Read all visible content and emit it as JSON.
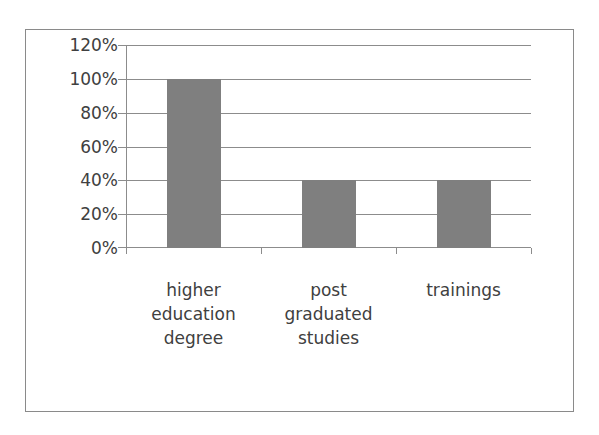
{
  "chart_data": {
    "type": "bar",
    "title": "",
    "xlabel": "",
    "ylabel": "",
    "categories": [
      "higher education degree",
      "post graduated studies",
      "trainings"
    ],
    "category_labels_wrapped": [
      "higher\neducation\ndegree",
      "post\ngraduated\nstudies",
      "trainings"
    ],
    "values": [
      100,
      40,
      40
    ],
    "value_format": "percent",
    "ylim": [
      0,
      120
    ],
    "yticks": [
      "0%",
      "20%",
      "40%",
      "60%",
      "80%",
      "100%",
      "120%"
    ],
    "grid": true,
    "legend": "none",
    "bar_color": "#7f7f7f"
  }
}
